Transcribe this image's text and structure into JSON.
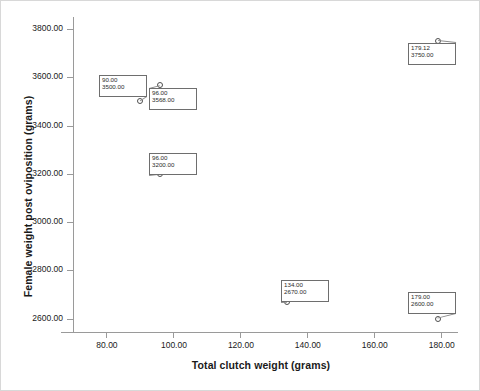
{
  "chart_data": {
    "type": "scatter",
    "title": "",
    "xlabel": "Total clutch weight (grams)",
    "ylabel": "Female weight post oviposition (grams)",
    "xlim": [
      70,
      185
    ],
    "ylim": [
      2540,
      3850
    ],
    "grid": false,
    "legend": null,
    "xticks": [
      "80.00",
      "100.00",
      "120.00",
      "140.00",
      "160.00",
      "180.00"
    ],
    "xtick_values": [
      80,
      100,
      120,
      140,
      160,
      180
    ],
    "yticks": [
      "2600.00",
      "2800.00",
      "3000.00",
      "3200.00",
      "3400.00",
      "3600.00",
      "3800.00"
    ],
    "ytick_values": [
      2600,
      2800,
      3000,
      3200,
      3400,
      3600,
      3800
    ],
    "marker": "open-circle",
    "points": [
      {
        "x": 90.0,
        "y": 3500.0,
        "label_x": "90.00",
        "label_y": "3500.00"
      },
      {
        "x": 96.0,
        "y": 3568.0,
        "label_x": "96.00",
        "label_y": "3568.00"
      },
      {
        "x": 96.0,
        "y": 3200.0,
        "label_x": "96.00",
        "label_y": "3200.00"
      },
      {
        "x": 179.12,
        "y": 3750.0,
        "label_x": "179.12",
        "label_y": "3750.00"
      },
      {
        "x": 134.0,
        "y": 2670.0,
        "label_x": "134.00",
        "label_y": "2670.00"
      },
      {
        "x": 179.0,
        "y": 2600.0,
        "label_x": "179.00",
        "label_y": "2600.00"
      }
    ],
    "callouts": [
      {
        "left": 26,
        "top": 58,
        "width": 48,
        "height": 22,
        "lx": "90.00",
        "ly": "3500.00"
      },
      {
        "left": 76,
        "top": 71,
        "width": 48,
        "height": 22,
        "lx": "96.00",
        "ly": "3568.00"
      },
      {
        "left": 76,
        "top": 136,
        "width": 48,
        "height": 22,
        "lx": "96.00",
        "ly": "3200.00"
      },
      {
        "left": 335,
        "top": 26,
        "width": 48,
        "height": 22,
        "lx": "179.12",
        "ly": "3750.00"
      },
      {
        "left": 208,
        "top": 263,
        "width": 48,
        "height": 22,
        "lx": "134.00",
        "ly": "2670.00"
      },
      {
        "left": 335,
        "top": 275,
        "width": 48,
        "height": 22,
        "lx": "179.00",
        "ly": "2600.00"
      }
    ]
  }
}
